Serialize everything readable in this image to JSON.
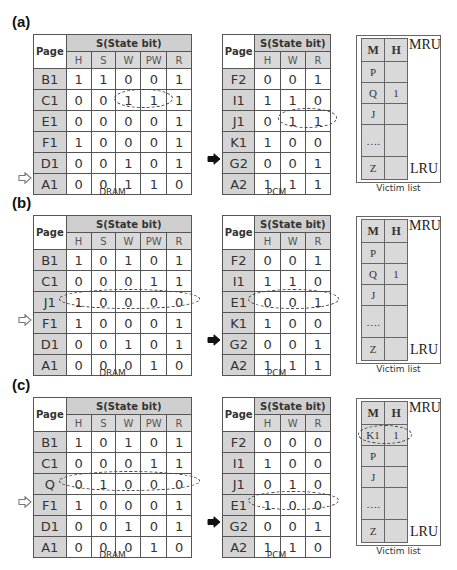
{
  "panels": [
    {
      "label": "(a)",
      "dram": {
        "caption": "DRAM",
        "page_header": "Page",
        "group_header": "S(State bit)",
        "columns": [
          "H",
          "S",
          "W",
          "PW",
          "R"
        ],
        "rows": [
          {
            "page": "B1",
            "bits": [
              "1",
              "1",
              "0",
              "0",
              "1"
            ]
          },
          {
            "page": "C1",
            "bits": [
              "0",
              "0",
              "1",
              "1",
              "1"
            ]
          },
          {
            "page": "E1",
            "bits": [
              "0",
              "0",
              "0",
              "0",
              "1"
            ]
          },
          {
            "page": "F1",
            "bits": [
              "1",
              "0",
              "0",
              "0",
              "1"
            ]
          },
          {
            "page": "D1",
            "bits": [
              "0",
              "0",
              "1",
              "0",
              "1"
            ]
          },
          {
            "page": "A1",
            "bits": [
              "0",
              "0",
              "1",
              "1",
              "0"
            ]
          }
        ],
        "pointer_row": 5,
        "highlight": {
          "row": 1,
          "from_col": 2,
          "to_col": 3
        }
      },
      "pcm": {
        "caption": "PCM",
        "page_header": "Page",
        "group_header": "S(State bit)",
        "columns": [
          "H",
          "W",
          "R"
        ],
        "rows": [
          {
            "page": "F2",
            "bits": [
              "0",
              "0",
              "1"
            ]
          },
          {
            "page": "I1",
            "bits": [
              "1",
              "1",
              "0"
            ]
          },
          {
            "page": "J1",
            "bits": [
              "0",
              "1",
              "1"
            ]
          },
          {
            "page": "K1",
            "bits": [
              "1",
              "0",
              "0"
            ]
          },
          {
            "page": "G2",
            "bits": [
              "0",
              "0",
              "1"
            ]
          },
          {
            "page": "A2",
            "bits": [
              "1",
              "1",
              "1"
            ]
          }
        ],
        "pointer_row": 4,
        "highlight": {
          "row": 2,
          "from_col": 1,
          "to_col": 2
        }
      },
      "victim": {
        "caption": "Victim list",
        "mru_label": "MRU",
        "lru_label": "LRU",
        "headers": [
          "M",
          "H"
        ],
        "rows": [
          {
            "m": "P",
            "h": ""
          },
          {
            "m": "Q",
            "h": "1"
          },
          {
            "m": "J",
            "h": ""
          },
          {
            "m": "….",
            "h": ""
          },
          {
            "m": "Z",
            "h": ""
          }
        ],
        "highlight_row": null
      }
    },
    {
      "label": "(b)",
      "dram": {
        "caption": "DRAM",
        "page_header": "Page",
        "group_header": "S(State bit)",
        "columns": [
          "H",
          "S",
          "W",
          "PW",
          "R"
        ],
        "rows": [
          {
            "page": "B1",
            "bits": [
              "1",
              "0",
              "1",
              "0",
              "1"
            ]
          },
          {
            "page": "C1",
            "bits": [
              "0",
              "0",
              "0",
              "1",
              "1"
            ]
          },
          {
            "page": "J1",
            "bits": [
              "1",
              "0",
              "0",
              "0",
              "0"
            ]
          },
          {
            "page": "F1",
            "bits": [
              "1",
              "0",
              "0",
              "0",
              "1"
            ]
          },
          {
            "page": "D1",
            "bits": [
              "0",
              "0",
              "1",
              "0",
              "1"
            ]
          },
          {
            "page": "A1",
            "bits": [
              "0",
              "0",
              "0",
              "1",
              "0"
            ]
          }
        ],
        "pointer_row": 3,
        "highlight": {
          "row": 2,
          "from_col": 0,
          "to_col": 4
        }
      },
      "pcm": {
        "caption": "PCM",
        "page_header": "Page",
        "group_header": "S(State bit)",
        "columns": [
          "H",
          "W",
          "R"
        ],
        "rows": [
          {
            "page": "F2",
            "bits": [
              "0",
              "0",
              "1"
            ]
          },
          {
            "page": "I1",
            "bits": [
              "1",
              "1",
              "0"
            ]
          },
          {
            "page": "E1",
            "bits": [
              "0",
              "0",
              "1"
            ]
          },
          {
            "page": "K1",
            "bits": [
              "1",
              "0",
              "0"
            ]
          },
          {
            "page": "G2",
            "bits": [
              "0",
              "0",
              "1"
            ]
          },
          {
            "page": "A2",
            "bits": [
              "1",
              "1",
              "1"
            ]
          }
        ],
        "pointer_row": 4,
        "highlight": {
          "row": 2,
          "from_col": 0,
          "to_col": 2
        }
      },
      "victim": {
        "caption": "Victim list",
        "mru_label": "MRU",
        "lru_label": "LRU",
        "headers": [
          "M",
          "H"
        ],
        "rows": [
          {
            "m": "P",
            "h": ""
          },
          {
            "m": "Q",
            "h": "1"
          },
          {
            "m": "J",
            "h": ""
          },
          {
            "m": "….",
            "h": ""
          },
          {
            "m": "Z",
            "h": ""
          }
        ],
        "highlight_row": null
      }
    },
    {
      "label": "(c)",
      "dram": {
        "caption": "DRAM",
        "page_header": "Page",
        "group_header": "S(State bit)",
        "columns": [
          "H",
          "S",
          "W",
          "PW",
          "R"
        ],
        "rows": [
          {
            "page": "B1",
            "bits": [
              "1",
              "0",
              "1",
              "0",
              "1"
            ]
          },
          {
            "page": "C1",
            "bits": [
              "0",
              "0",
              "0",
              "1",
              "1"
            ]
          },
          {
            "page": "Q",
            "bits": [
              "0",
              "1",
              "0",
              "0",
              "0"
            ]
          },
          {
            "page": "F1",
            "bits": [
              "1",
              "0",
              "0",
              "0",
              "1"
            ]
          },
          {
            "page": "D1",
            "bits": [
              "0",
              "0",
              "1",
              "0",
              "1"
            ]
          },
          {
            "page": "A1",
            "bits": [
              "0",
              "0",
              "0",
              "1",
              "0"
            ]
          }
        ],
        "pointer_row": 3,
        "highlight": {
          "row": 2,
          "from_col": 0,
          "to_col": 4
        }
      },
      "pcm": {
        "caption": "PCM",
        "page_header": "Page",
        "group_header": "S(State bit)",
        "columns": [
          "H",
          "W",
          "R"
        ],
        "rows": [
          {
            "page": "F2",
            "bits": [
              "0",
              "0",
              "0"
            ]
          },
          {
            "page": "I1",
            "bits": [
              "1",
              "0",
              "0"
            ]
          },
          {
            "page": "J1",
            "bits": [
              "0",
              "1",
              "0"
            ]
          },
          {
            "page": "E1",
            "bits": [
              "1",
              "0",
              "0"
            ]
          },
          {
            "page": "G2",
            "bits": [
              "0",
              "0",
              "1"
            ]
          },
          {
            "page": "A2",
            "bits": [
              "1",
              "1",
              "0"
            ]
          }
        ],
        "pointer_row": 4,
        "highlight": {
          "row": 3,
          "from_col": 0,
          "to_col": 2
        }
      },
      "victim": {
        "caption": "Victim list",
        "mru_label": "MRU",
        "lru_label": "LRU",
        "headers": [
          "M",
          "H"
        ],
        "rows": [
          {
            "m": "K1",
            "h": "1"
          },
          {
            "m": "P",
            "h": ""
          },
          {
            "m": "J",
            "h": ""
          },
          {
            "m": "….",
            "h": ""
          },
          {
            "m": "Z",
            "h": ""
          }
        ],
        "highlight_row": 0
      }
    }
  ],
  "colors": {
    "header_gray": "#cfcfcf",
    "page_col_gray": "#d4d4d4",
    "border": "#555555",
    "ellipse": "#444444"
  }
}
